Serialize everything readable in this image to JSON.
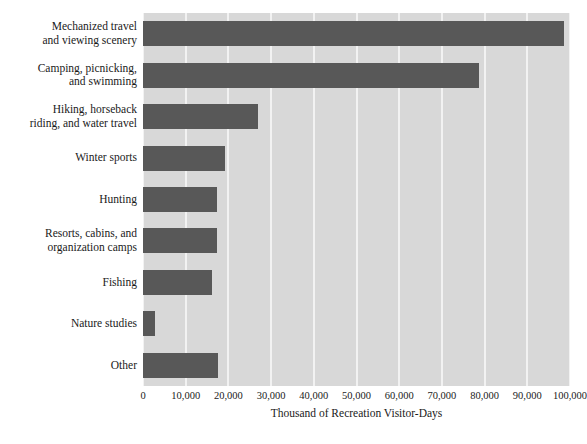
{
  "chart_data": {
    "type": "bar",
    "orientation": "horizontal",
    "title": "",
    "xlabel": "Thousand of Recreation Visitor-Days",
    "ylabel": "",
    "xlim": [
      0,
      100000
    ],
    "xticks": [
      0,
      10000,
      20000,
      30000,
      40000,
      50000,
      60000,
      70000,
      80000,
      90000,
      100000
    ],
    "xtick_labels": [
      "0",
      "10,000",
      "20,000",
      "30,000",
      "40,000",
      "50,000",
      "60,000",
      "70,000",
      "80,000",
      "90,000",
      "100,000"
    ],
    "grid": "vertical",
    "legend": "none",
    "categories": [
      "Mechanized travel\nand viewing scenery",
      "Camping, picnicking,\nand swimming",
      "Hiking, horseback\nriding, and water travel",
      "Winter sports",
      "Hunting",
      "Resorts, cabins, and\norganization camps",
      "Fishing",
      "Nature studies",
      "Other"
    ],
    "values": [
      98500,
      78800,
      27000,
      19300,
      17400,
      17400,
      16200,
      2800,
      17600
    ],
    "bar_color": "#585858",
    "plot_background": "#d8d8d8",
    "gridline_color": "#f2f2f2",
    "page_background": "#ffffff"
  }
}
